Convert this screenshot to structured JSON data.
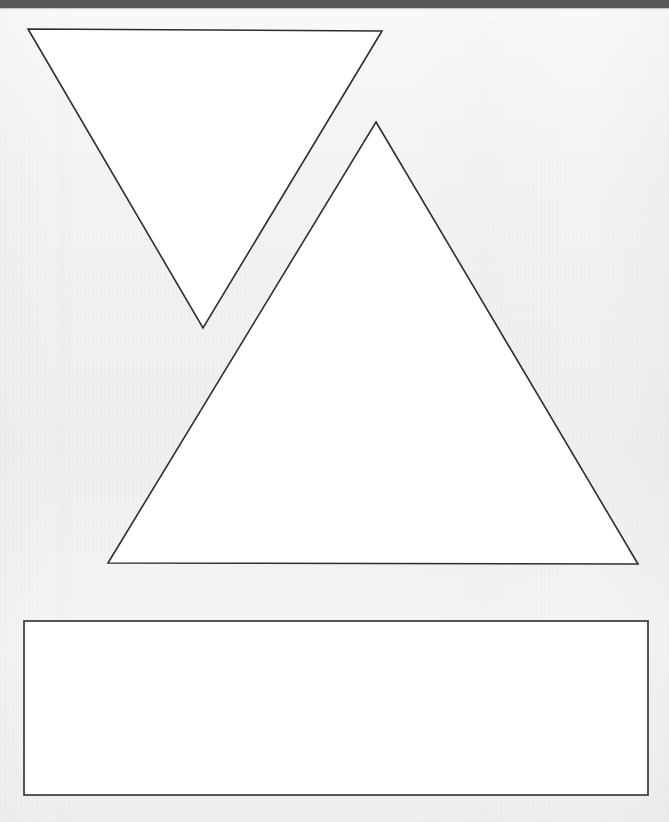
{
  "canvas": {
    "width": 669,
    "height": 822,
    "background_color": "#f2f2f2",
    "background_label": "textured light gray paper background"
  },
  "top_bar": {
    "label": "",
    "color": "#555759",
    "height_px": 8
  },
  "shapes": {
    "stroke_color": "#2e2e2e",
    "fill_color": "#ffffff",
    "stroke_width_px": 1.6,
    "items": [
      {
        "name": "inverted-triangle",
        "type": "triangle",
        "orientation": "point-down",
        "points": "28,29 382,31 203,328",
        "label": "Inverted triangle"
      },
      {
        "name": "upright-triangle",
        "type": "triangle",
        "orientation": "point-up",
        "points": "376,122 638,564 108,563",
        "label": "Upright triangle"
      },
      {
        "name": "rectangle",
        "type": "rectangle",
        "x": 24,
        "y": 621,
        "width": 624,
        "height": 174,
        "label": "Rectangle"
      }
    ]
  }
}
